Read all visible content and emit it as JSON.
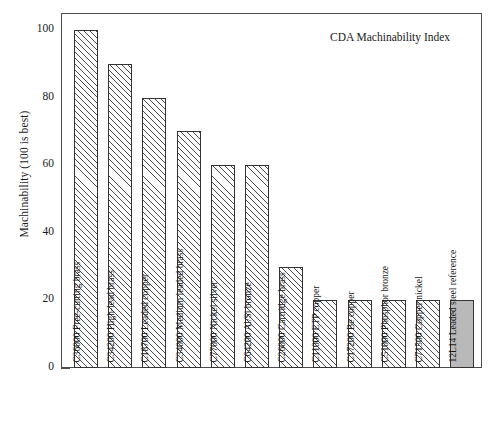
{
  "chart_data": {
    "type": "bar",
    "title": "CDA Machinability Index",
    "xlabel": "",
    "ylabel": "Machinability (100 is best)",
    "ylim": [
      0,
      105
    ],
    "yticks": [
      0,
      20,
      40,
      60,
      80,
      100
    ],
    "grid": false,
    "legend": "none",
    "categories": [
      "C36000 Free-cutting brass",
      "C34200 High-lead brass",
      "C18700 Leaded copper",
      "C34000 Medium leaded brass",
      "C77000 Nickel silver",
      "C64200 Al/Si bronze",
      "C26000 Cartridge brass",
      "C11000 ETP copper",
      "C17200 Be copper",
      "C51000 Phosphor bronze",
      "C71500 Copper nickel",
      "12L14 Leaded steel reference"
    ],
    "values": [
      100,
      90,
      80,
      70,
      60,
      60,
      30,
      20,
      20,
      20,
      20,
      20
    ],
    "bar_styles": [
      "hatched",
      "hatched",
      "hatched",
      "hatched",
      "hatched",
      "hatched",
      "hatched",
      "hatched",
      "hatched",
      "hatched",
      "hatched",
      "solid"
    ],
    "colors": {
      "hatch_line": "#4a4a4a",
      "bar_fill": "#fdfdfd",
      "solid_fill": "#b9b9b9",
      "bar_edge": "#333333",
      "axis": "#4d4d4d",
      "text": "#1a1a1a"
    }
  },
  "axis": {
    "tick_labels": [
      "0",
      "20",
      "40",
      "60",
      "80",
      "100"
    ]
  },
  "scan": {
    "artifact": ""
  }
}
